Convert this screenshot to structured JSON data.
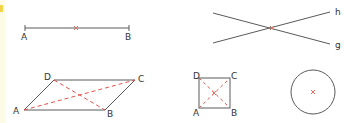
{
  "colors": {
    "stroke": "#5a5a5a",
    "dashed": "#e8524a",
    "midpoint": "#e07060",
    "label": "#333333",
    "accent_tab": "#f3d24a",
    "strip": "#fdfbe6"
  },
  "figures": {
    "segment": {
      "description": "Segment AB with midpoint",
      "labels": {
        "a": "A",
        "b": "B"
      }
    },
    "intersecting_lines": {
      "description": "Two lines h and g intersecting",
      "labels": {
        "h": "h",
        "g": "g"
      }
    },
    "parallelogram": {
      "description": "Parallelogram ABCD with dashed diagonals",
      "labels": {
        "a": "A",
        "b": "B",
        "c": "C",
        "d": "D"
      }
    },
    "square": {
      "description": "Square ABCD with dashed diagonals",
      "labels": {
        "a": "A",
        "b": "B",
        "c": "C",
        "d": "D"
      }
    },
    "circle": {
      "description": "Circle with center marked"
    }
  }
}
